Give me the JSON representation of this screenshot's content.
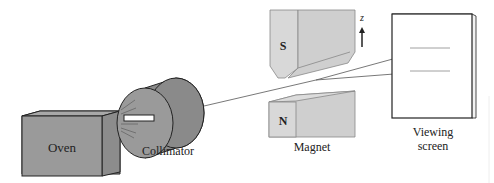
{
  "diagram": {
    "colors": {
      "body_fill": "#9a9a9a",
      "body_fill_dark": "#8a8a8a",
      "magnet_fill": "#d8d8d8",
      "magnet_fill_dark": "#cfcfcf",
      "stroke": "#222222",
      "beam": "#555555",
      "screen_fill": "#ffffff"
    },
    "components": {
      "oven": {
        "label": "Oven"
      },
      "collimator": {
        "label": "Collimator"
      },
      "magnet": {
        "label": "Magnet",
        "south_pole": "S",
        "north_pole": "N"
      },
      "axis": {
        "label": "z"
      },
      "screen": {
        "label_line1": "Viewing",
        "label_line2": "screen"
      }
    }
  }
}
